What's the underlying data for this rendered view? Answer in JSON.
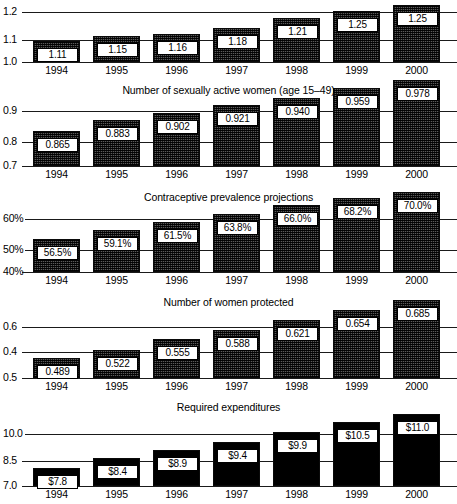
{
  "figure": {
    "years": [
      "1994",
      "1995",
      "1996",
      "1997",
      "1998",
      "1999",
      "2000"
    ],
    "colors": {
      "bar_dither": "#5a5a5a",
      "bar_solid": "#000000",
      "axis": "#1a1a1a",
      "label_box_bg": "#ffffff",
      "background": "#ffffff"
    }
  },
  "chart_data": [
    {
      "type": "bar",
      "title": "",
      "caption_below": "Number of sexually active women (age 15–49)",
      "xlabel": "",
      "ylabel": "",
      "categories": [
        "1994",
        "1995",
        "1996",
        "1997",
        "1998",
        "1999",
        "2000"
      ],
      "values": [
        1.11,
        1.15,
        1.16,
        1.18,
        1.21,
        1.25,
        1.25
      ],
      "data_labels": [
        "1.11",
        "1.15",
        "1.16",
        "1.18",
        "1.21",
        "1.25",
        "1.25"
      ],
      "yticks": [
        "1.2",
        "1.1",
        "1.0"
      ],
      "ytick_values": [
        1.2,
        1.1,
        1.0
      ],
      "ylim": [
        1.0,
        1.2
      ],
      "grid": true,
      "legend": "none",
      "bar_style": "dithered-gray"
    },
    {
      "type": "bar",
      "title": "Number of sexually active women (age 15–49)",
      "caption_below": "Contraceptive prevalence projections",
      "xlabel": "",
      "ylabel": "",
      "categories": [
        "1994",
        "1995",
        "1996",
        "1997",
        "1998",
        "1999",
        "2000"
      ],
      "values": [
        0.865,
        0.883,
        0.902,
        0.921,
        0.94,
        0.959,
        0.978
      ],
      "data_labels": [
        "0.865",
        "0.883",
        "0.902",
        "0.921",
        "0.940",
        "0.959",
        "0.978"
      ],
      "yticks": [
        "0.9",
        "0.8",
        "0.7"
      ],
      "ytick_values": [
        0.9,
        0.8,
        0.7
      ],
      "ylim": [
        0.7,
        0.9
      ],
      "grid": true,
      "legend": "none",
      "bar_style": "dithered-gray"
    },
    {
      "type": "bar",
      "title": "Contraceptive prevalence projections",
      "caption_below": "Number of women protected",
      "xlabel": "",
      "ylabel": "",
      "categories": [
        "1994",
        "1995",
        "1996",
        "1997",
        "1998",
        "1999",
        "2000"
      ],
      "values": [
        56.5,
        59.1,
        61.5,
        63.8,
        66.0,
        68.2,
        70.0
      ],
      "data_labels": [
        "56.5%",
        "59.1%",
        "61.5%",
        "63.8%",
        "66.0%",
        "68.2%",
        "70.0%"
      ],
      "yticks": [
        "60%",
        "50%",
        "40%"
      ],
      "ytick_values": [
        60,
        50,
        40
      ],
      "ylim": [
        40,
        60
      ],
      "grid": true,
      "legend": "none",
      "bar_style": "dithered-gray"
    },
    {
      "type": "bar",
      "title": "Number of women protected",
      "caption_below": "Required expenditures",
      "xlabel": "",
      "ylabel": "",
      "categories": [
        "1994",
        "1995",
        "1996",
        "1997",
        "1998",
        "1999",
        "2000"
      ],
      "values": [
        0.489,
        0.522,
        0.555,
        0.588,
        0.621,
        0.654,
        0.685
      ],
      "data_labels": [
        "0.489",
        "0.522",
        "0.555",
        "0.588",
        "0.621",
        "0.654",
        "0.685"
      ],
      "yticks": [
        "0.6",
        "0.4",
        "0.5"
      ],
      "ytick_values": [
        0.6,
        0.4,
        0.5
      ],
      "ylim": [
        0.45,
        0.65
      ],
      "grid": true,
      "legend": "none",
      "bar_style": "dithered-gray"
    },
    {
      "type": "bar",
      "title": "Required expenditures",
      "caption_below": "",
      "xlabel": "",
      "ylabel": "",
      "categories": [
        "1994",
        "1995",
        "1996",
        "1997",
        "1998",
        "1999",
        "2000"
      ],
      "values": [
        7.8,
        8.4,
        8.9,
        9.4,
        9.9,
        10.5,
        11.0
      ],
      "data_labels": [
        "$7.8",
        "$8.4",
        "$8.9",
        "$9.4",
        "$9.9",
        "$10.5",
        "$11.0"
      ],
      "yticks": [
        "10.0",
        "8.5",
        "7.0"
      ],
      "ytick_values": [
        10.0,
        8.5,
        7.0
      ],
      "ylim": [
        7.0,
        10.0
      ],
      "grid": true,
      "legend": "none",
      "bar_style": "solid-black"
    }
  ]
}
